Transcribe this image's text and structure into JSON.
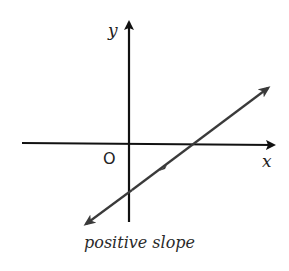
{
  "diagram": {
    "title": "positive slope",
    "axes": {
      "x_label": "x",
      "y_label": "y",
      "origin_label": "O"
    },
    "line": {
      "description": "line with positive slope",
      "x_intercept": "positive",
      "y_intercept": "negative"
    },
    "colors": {
      "axes": "#111111",
      "line": "#3a3a3a"
    }
  }
}
